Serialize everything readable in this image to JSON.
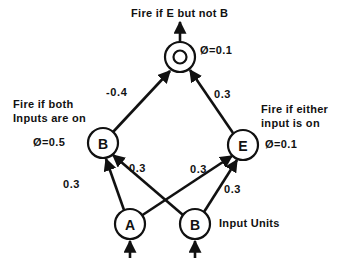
{
  "diagram": {
    "title_top": "Fire if E but not B",
    "annotations": {
      "left_line1": "Fire if both",
      "left_line2": "Inputs are on",
      "right_line1": "Fire if either",
      "right_line2": "input is on",
      "input_units": "Input Units"
    },
    "nodes": [
      {
        "id": "O",
        "label": "O",
        "threshold": "Ø=0.1",
        "x": 180,
        "y": 57,
        "r": 15
      },
      {
        "id": "B_hidden",
        "label": "B",
        "threshold": "Ø=0.5",
        "x": 103,
        "y": 143,
        "r": 15
      },
      {
        "id": "E_hidden",
        "label": "E",
        "threshold": "Ø=0.1",
        "x": 243,
        "y": 145,
        "r": 15
      },
      {
        "id": "A_input",
        "label": "A",
        "threshold": "",
        "x": 130,
        "y": 224,
        "r": 15
      },
      {
        "id": "B_input",
        "label": "B",
        "threshold": "",
        "x": 195,
        "y": 224,
        "r": 15
      }
    ],
    "edges": [
      {
        "from": "B_hidden",
        "to": "O",
        "weight": "-0.4"
      },
      {
        "from": "E_hidden",
        "to": "O",
        "weight": "0.3"
      },
      {
        "from": "A_input",
        "to": "B_hidden",
        "weight": "0.3"
      },
      {
        "from": "B_input",
        "to": "B_hidden",
        "weight": "0.3"
      },
      {
        "from": "A_input",
        "to": "E_hidden",
        "weight": "0.3"
      },
      {
        "from": "B_input",
        "to": "E_hidden",
        "weight": "0.3"
      }
    ],
    "colors": {
      "ink": "#111111",
      "paper": "#ffffff"
    }
  }
}
